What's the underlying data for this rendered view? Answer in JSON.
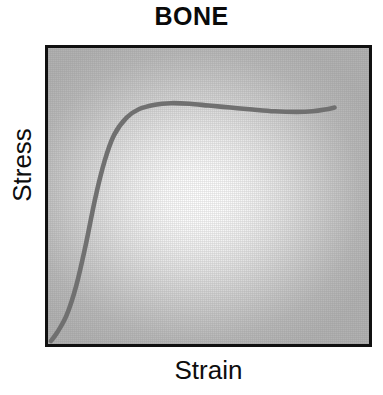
{
  "figure": {
    "width": 383,
    "height": 395,
    "page_background": "#ffffff"
  },
  "chart_data": {
    "type": "line",
    "title": "BONE",
    "xlabel": "Strain",
    "ylabel": "Stress",
    "grid": false,
    "legend": null,
    "axis_ticks": {
      "x": [],
      "y": []
    },
    "xlim": [
      0,
      1
    ],
    "ylim": [
      0,
      1
    ],
    "plot_background_center_color": "#ffffff",
    "plot_background_edge_color": "#b2b2b2",
    "frame_color": "#111111",
    "series": [
      {
        "name": "bone stress-strain",
        "color": "#707070",
        "line_width": 4.6,
        "description": "toe region, steep elastic rise, yield, long plateau with slight dip, small terminal upturn at fracture",
        "x": [
          0.0,
          0.02,
          0.05,
          0.08,
          0.11,
          0.14,
          0.17,
          0.2,
          0.24,
          0.28,
          0.33,
          0.38,
          0.44,
          0.5,
          0.57,
          0.64,
          0.71,
          0.78,
          0.83,
          0.87,
          0.9
        ],
        "y": [
          0.0,
          0.03,
          0.09,
          0.19,
          0.33,
          0.49,
          0.62,
          0.71,
          0.77,
          0.8,
          0.815,
          0.82,
          0.818,
          0.812,
          0.805,
          0.798,
          0.792,
          0.79,
          0.792,
          0.798,
          0.805
        ]
      }
    ],
    "annotations": []
  },
  "labels": {
    "title": "BONE",
    "y_axis": "Stress",
    "x_axis": "Strain"
  }
}
